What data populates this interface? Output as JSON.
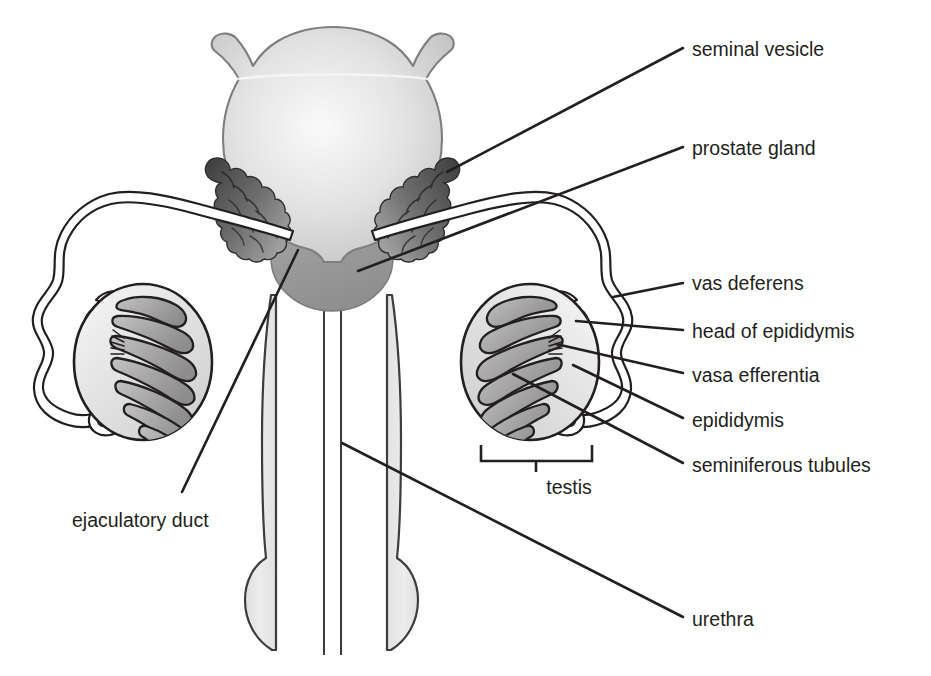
{
  "figure": {
    "background_color": "#ffffff",
    "ink_color": "#231f20"
  },
  "labels": {
    "seminal_vesicle": "seminal vesicle",
    "prostate_gland": "prostate gland",
    "vas_deferens": "vas deferens",
    "head_of_epididymis": "head of epididymis",
    "vasa_efferentia": "vasa efferentia",
    "epididymis": "epididymis",
    "seminiferous_tubules": "seminiferous tubules",
    "ejaculatory_duct": "ejaculatory duct",
    "urethra": "urethra",
    "testis": "testis"
  },
  "colors": {
    "bladder_fill_light": "#fdfdfd",
    "bladder_fill_mid": "#d4d4d4",
    "bladder_fill_edge": "#bdbdbd",
    "prostate_fill": "#9c9c9c",
    "seminal_vesicle_dark": "#4a4a4a",
    "seminal_vesicle_light": "#8e8e8e",
    "testis_fill": "#e2e2e2",
    "tubule_fill": "#a9a9a9",
    "penis_fill": "#e6e6e6",
    "outline": "#231f20"
  },
  "structures": [
    {
      "name": "urinary-bladder",
      "side": "center"
    },
    {
      "name": "prostate-gland",
      "side": "center"
    },
    {
      "name": "seminal-vesicle",
      "side": "left"
    },
    {
      "name": "seminal-vesicle",
      "side": "right"
    },
    {
      "name": "vas-deferens",
      "side": "left"
    },
    {
      "name": "vas-deferens",
      "side": "right"
    },
    {
      "name": "testis",
      "side": "left"
    },
    {
      "name": "testis",
      "side": "right"
    },
    {
      "name": "epididymis",
      "side": "left"
    },
    {
      "name": "epididymis",
      "side": "right"
    },
    {
      "name": "penis-urethra",
      "side": "center"
    }
  ]
}
